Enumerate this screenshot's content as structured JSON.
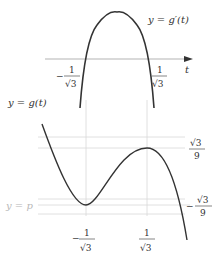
{
  "upper_graph": {
    "label": "y = g′(t)",
    "axis_label": "t",
    "roots": [
      {
        "num": "1",
        "den": "√3",
        "sign": "−"
      },
      {
        "num": "1",
        "den": "√3",
        "sign": ""
      }
    ]
  },
  "lower_graph": {
    "label": "y = g(t)",
    "line_label": "y = p",
    "x_ticks": [
      {
        "num": "1",
        "den": "√3",
        "sign": "−"
      },
      {
        "num": "1",
        "den": "√3",
        "sign": ""
      }
    ],
    "y_ticks": [
      {
        "num": "√3",
        "den": "9",
        "sign": ""
      },
      {
        "num": "√3",
        "den": "9",
        "sign": "−"
      }
    ]
  },
  "colors": {
    "curve": "#333333",
    "grid": "#d8d8d8",
    "muted_label": "#b8b8b8"
  }
}
